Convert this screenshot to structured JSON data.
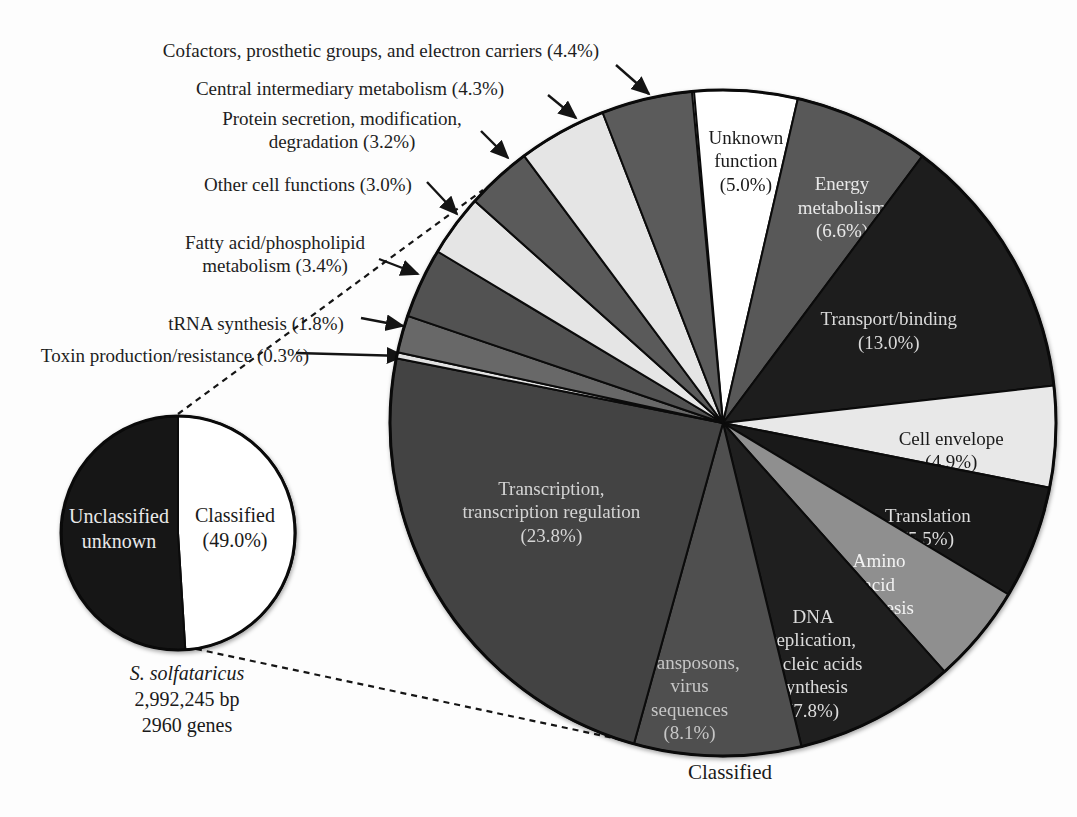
{
  "chart_data": {
    "type": "pie",
    "title": "",
    "genome_caption": {
      "organism": "S. solfataricus",
      "base_pairs": "2,992,245 bp",
      "genes": "2960 genes"
    },
    "overview_pie": {
      "slices": [
        {
          "id": "classified",
          "label": "Classified",
          "value": 49.0,
          "label_lines": [
            "Classified",
            "(49.0%)"
          ],
          "color": "#ffffff",
          "text_color": "#1a1a1a"
        },
        {
          "id": "unclassified-unknown",
          "label": "Unclassified unknown",
          "value": 51.0,
          "label_lines": [
            "Unclassified",
            "unknown"
          ],
          "color": "#161616",
          "text_color": "#e9e9e9"
        }
      ]
    },
    "classified_pie": {
      "bottom_label": "Classified",
      "slices": [
        {
          "id": "unknown-function",
          "label": "Unknown function",
          "value": 5.0,
          "label_lines": [
            "Unknown",
            "function",
            "(5.0%)"
          ],
          "color": "#ffffff",
          "text_color": "#1a1a1a",
          "label_mode": "internal"
        },
        {
          "id": "energy-metabolism",
          "label": "Energy metabolism",
          "value": 6.6,
          "label_lines": [
            "Energy",
            "metabolism",
            "(6.6%)"
          ],
          "color": "#585858",
          "text_color": "#e8e8e8",
          "label_mode": "internal"
        },
        {
          "id": "transport-binding",
          "label": "Transport/binding",
          "value": 13.0,
          "label_lines": [
            "Transport/binding",
            "(13.0%)"
          ],
          "color": "#1d1d1d",
          "text_color": "#d9d9d9",
          "label_mode": "internal"
        },
        {
          "id": "cell-envelope",
          "label": "Cell envelope",
          "value": 4.9,
          "label_lines": [
            "Cell envelope",
            "(4.9%)"
          ],
          "color": "#e8e8e8",
          "text_color": "#1a1a1a",
          "label_mode": "internal"
        },
        {
          "id": "translation",
          "label": "Translation",
          "value": 5.5,
          "label_lines": [
            "Translation",
            "(5.5%)"
          ],
          "color": "#191919",
          "text_color": "#dcdcdc",
          "label_mode": "internal"
        },
        {
          "id": "amino-acid-synthesis",
          "label": "Amino acid synthesis",
          "value": 4.8,
          "label_lines": [
            "Amino",
            "acid",
            "synthesis",
            "(4.8%)"
          ],
          "color": "#8f8f8f",
          "text_color": "#f2f2f2",
          "label_mode": "internal"
        },
        {
          "id": "dna-replication-nucleic-acids-synthesis",
          "label": "DNA replication, nucleic acids synthesis",
          "value": 7.8,
          "label_lines": [
            "DNA",
            "replication,",
            "nucleic acids",
            "synthesis",
            "(7.8%)"
          ],
          "color": "#1f1f1f",
          "text_color": "#dcdcdc",
          "label_mode": "internal"
        },
        {
          "id": "transposons-virus-sequences",
          "label": "Transposons, virus sequences",
          "value": 8.1,
          "label_lines": [
            "Transposons,",
            "virus",
            "sequences",
            "(8.1%)"
          ],
          "color": "#4f4f4f",
          "text_color": "#c6c6c6",
          "label_mode": "internal"
        },
        {
          "id": "transcription-regulation",
          "label": "Transcription, transcription regulation",
          "value": 23.8,
          "label_lines": [
            "Transcription,",
            "transcription regulation",
            "(23.8%)"
          ],
          "color": "#434343",
          "text_color": "#d4d4d4",
          "label_mode": "internal"
        },
        {
          "id": "toxin-production-resistance",
          "label": "Toxin production/resistance",
          "value": 0.3,
          "label_lines": [
            "Toxin production/resistance (0.3%)"
          ],
          "color": "#e2e2e2",
          "text_color": "#1e1e1e",
          "label_mode": "external"
        },
        {
          "id": "trna-synthesis",
          "label": "tRNA synthesis",
          "value": 1.8,
          "label_lines": [
            "tRNA synthesis (1.8%)"
          ],
          "color": "#686868",
          "text_color": "#1e1e1e",
          "label_mode": "external"
        },
        {
          "id": "fatty-acid-phospholipid-metabolism",
          "label": "Fatty acid/phospholipid metabolism",
          "value": 3.4,
          "label_lines": [
            "Fatty acid/phospholipid",
            "metabolism (3.4%)"
          ],
          "color": "#525252",
          "text_color": "#1e1e1e",
          "label_mode": "external"
        },
        {
          "id": "other-cell-functions",
          "label": "Other cell functions",
          "value": 3.0,
          "label_lines": [
            "Other cell functions (3.0%)"
          ],
          "color": "#e5e5e5",
          "text_color": "#1e1e1e",
          "label_mode": "external"
        },
        {
          "id": "protein-secretion-modification-degradation",
          "label": "Protein secretion, modification, degradation",
          "value": 3.2,
          "label_lines": [
            "Protein secretion, modification,",
            "degradation (3.2%)"
          ],
          "color": "#5a5a5a",
          "text_color": "#1e1e1e",
          "label_mode": "external"
        },
        {
          "id": "central-intermediary-metabolism",
          "label": "Central intermediary metabolism",
          "value": 4.3,
          "label_lines": [
            "Central intermediary metabolism (4.3%)"
          ],
          "color": "#e5e5e5",
          "text_color": "#1e1e1e",
          "label_mode": "external"
        },
        {
          "id": "cofactors-prosthetic-groups-electron-carriers",
          "label": "Cofactors, prosthetic groups, and electron carriers",
          "value": 4.4,
          "label_lines": [
            "Cofactors, prosthetic groups, and electron carriers (4.4%)"
          ],
          "color": "#5b5b5b",
          "text_color": "#1e1e1e",
          "label_mode": "external"
        }
      ]
    }
  }
}
